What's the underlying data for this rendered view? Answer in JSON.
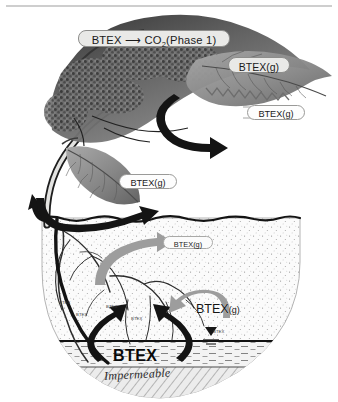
{
  "figure": {
    "colors": {
      "chip_fill": "#e9e9e7",
      "chip_stroke": "#8d8d8b",
      "callout_fill": "#fdfdfd",
      "callout_stroke": "#9a9a98",
      "dark_arrow": "#161616",
      "gray_arrow": "#9b9b9b",
      "soil_fill": "#fbfbfb",
      "groundwater_fill": "#f2f2f2",
      "impermeable_fill": "#ebebeb",
      "rule": "#9d9d9d"
    },
    "labels": {
      "canopy_reaction": "BTEX",
      "canopy_reaction_product": "CO",
      "canopy_reaction_sub": "2",
      "canopy_reaction_phase": "(Phase 1)",
      "canopy_gas": "BTEX(g)",
      "mid_right_gas": "BTEX(g)",
      "low_left_gas": "BTEX(g)",
      "soil_upward_gas": "BTEX(g)",
      "vadose_gas": "BTEX",
      "vadose_gas_sub": "(g)",
      "groundwater": "BTEX",
      "impermeable": "Impermeable"
    },
    "soil_tags": [
      {
        "text": "BTEX",
        "x": 59,
        "y": 301
      },
      {
        "text": "BTEX",
        "x": 76,
        "y": 313
      },
      {
        "text": "BTEX",
        "x": 106,
        "y": 305
      },
      {
        "text": "BTEX",
        "x": 131,
        "y": 317
      },
      {
        "text": "BTEX",
        "x": 213,
        "y": 330
      }
    ],
    "icons": {
      "water_table_marker": "water-table-triangle",
      "top_rule": "horizontal-rule"
    }
  }
}
